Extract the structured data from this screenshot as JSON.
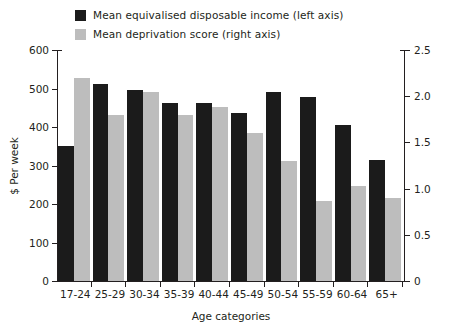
{
  "legend": {
    "items": [
      {
        "label": "Mean equivalised disposable income (left axis)",
        "color": "#1b1b1b",
        "icon": "square-swatch-dark"
      },
      {
        "label": "Mean deprivation score (right axis)",
        "color": "#bdbdbd",
        "icon": "square-swatch-grey"
      }
    ]
  },
  "axes": {
    "y_left_title": "$ Per week",
    "y_left_ticks": [
      "0",
      "100",
      "200",
      "300",
      "400",
      "500",
      "600"
    ],
    "y_right_ticks": [
      "0",
      "0.5",
      "1.0",
      "1.5",
      "2.0",
      "2.5"
    ],
    "x_title": "Age categories"
  },
  "chart_data": {
    "type": "bar",
    "title": "",
    "subtitle": "",
    "xlabel": "Age categories",
    "ylabel": "$ Per week",
    "y2label": "",
    "ylim": [
      0,
      600
    ],
    "y2lim": [
      0,
      2.5
    ],
    "yticks": [
      0,
      100,
      200,
      300,
      400,
      500,
      600
    ],
    "y2ticks": [
      0,
      0.5,
      1.0,
      1.5,
      2.0,
      2.5
    ],
    "grid": false,
    "legend_position": "top",
    "categories": [
      "17-24",
      "25-29",
      "30-34",
      "35-39",
      "40-44",
      "45-49",
      "50-54",
      "55-59",
      "60-64",
      "65+"
    ],
    "series": [
      {
        "name": "Mean equivalised disposable income (left axis)",
        "axis": "left",
        "color": "#1b1b1b",
        "values": [
          350,
          513,
          495,
          462,
          462,
          437,
          492,
          478,
          405,
          315
        ]
      },
      {
        "name": "Mean deprivation score (right axis)",
        "axis": "right",
        "color": "#bdbdbd",
        "values": [
          2.2,
          1.8,
          2.05,
          1.8,
          1.88,
          1.6,
          1.3,
          0.87,
          1.03,
          0.9
        ]
      }
    ]
  }
}
